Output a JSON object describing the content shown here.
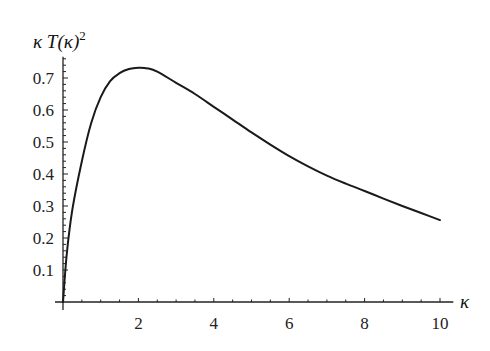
{
  "chart_data": {
    "type": "line",
    "title": "",
    "xlabel": "κ",
    "ylabel": "κ T(κ)²",
    "ylabel_parts": {
      "base": "κ T(κ)",
      "sup": "2"
    },
    "xlim": [
      0,
      10.3
    ],
    "ylim": [
      0,
      0.76
    ],
    "grid": false,
    "legend": null,
    "x_ticks": [
      2,
      4,
      6,
      8,
      10
    ],
    "x_tick_labels": [
      "2",
      "4",
      "6",
      "8",
      "10"
    ],
    "x_minor_step": 0.5,
    "y_ticks": [
      0.1,
      0.2,
      0.3,
      0.4,
      0.5,
      0.6,
      0.7
    ],
    "y_tick_labels": [
      "0.1",
      "0.2",
      "0.3",
      "0.4",
      "0.5",
      "0.6",
      "0.7"
    ],
    "y_minor_step": 0.02,
    "series": [
      {
        "name": "κ T(κ)²",
        "color": "#1a1a1a",
        "x": [
          0,
          0.1,
          0.25,
          0.5,
          0.75,
          1,
          1.25,
          1.5,
          1.75,
          2,
          2.25,
          2.5,
          3,
          3.5,
          4,
          4.5,
          5,
          5.5,
          6,
          6.5,
          7,
          7.5,
          8,
          8.5,
          9,
          9.5,
          10
        ],
        "values": [
          0,
          0.15,
          0.29,
          0.44,
          0.56,
          0.64,
          0.69,
          0.715,
          0.728,
          0.732,
          0.73,
          0.72,
          0.685,
          0.65,
          0.61,
          0.57,
          0.53,
          0.492,
          0.456,
          0.424,
          0.395,
          0.37,
          0.347,
          0.323,
          0.3,
          0.278,
          0.256
        ]
      }
    ]
  }
}
